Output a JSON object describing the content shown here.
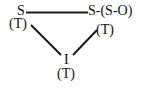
{
  "diagram": {
    "type": "triangle-relationship",
    "nodes": [
      {
        "id": "S",
        "label": "S",
        "sublabel": "(T)",
        "position": "top-left"
      },
      {
        "id": "S-SO",
        "label": "S-(S-O)",
        "sublabel": "(T)",
        "position": "top-right"
      },
      {
        "id": "I",
        "label": "I",
        "sublabel": "(T)",
        "position": "bottom-center"
      }
    ],
    "edges": [
      {
        "from": "S",
        "to": "S-SO"
      },
      {
        "from": "S",
        "to": "I"
      },
      {
        "from": "S-SO",
        "to": "I"
      }
    ],
    "colors": {
      "line": "#1a1a1a",
      "text": "#111111",
      "background": "#ffffff"
    }
  }
}
